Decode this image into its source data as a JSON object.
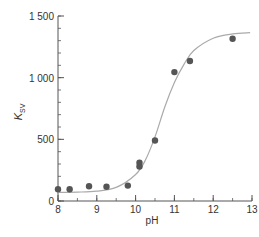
{
  "chart_data": {
    "type": "scatter",
    "title": "",
    "xlabel": "pH",
    "ylabel": "K",
    "ylabel_subscript": "SV",
    "xlim": [
      8,
      13
    ],
    "ylim": [
      0,
      1500
    ],
    "grid": false,
    "legend": null,
    "x_ticks": [
      8,
      9,
      10,
      11,
      12,
      13
    ],
    "x_tick_labels": [
      "8",
      "9",
      "10",
      "11",
      "12",
      "13"
    ],
    "x_minor_step": 0.5,
    "y_ticks": [
      0,
      500,
      1000,
      1500
    ],
    "y_tick_labels": [
      "0",
      "500",
      "1 000",
      "1 500"
    ],
    "y_minor_step": 100,
    "series": [
      {
        "name": "measured",
        "kind": "points",
        "color": "#555555",
        "x": [
          8.0,
          8.3,
          8.8,
          9.25,
          9.8,
          10.1,
          10.1,
          10.5,
          11.0,
          11.4,
          12.5
        ],
        "y": [
          95,
          95,
          120,
          115,
          125,
          310,
          280,
          490,
          1045,
          1135,
          1315
        ]
      },
      {
        "name": "fit",
        "kind": "sigmoid-curve",
        "color": "#aaaaaa",
        "x": [
          8.0,
          8.5,
          9.0,
          9.5,
          10.0,
          10.25,
          10.5,
          10.75,
          11.0,
          11.25,
          11.5,
          12.0,
          12.5,
          12.95
        ],
        "y": [
          70,
          72,
          80,
          110,
          215,
          330,
          520,
          760,
          960,
          1110,
          1220,
          1320,
          1355,
          1365
        ]
      }
    ]
  }
}
